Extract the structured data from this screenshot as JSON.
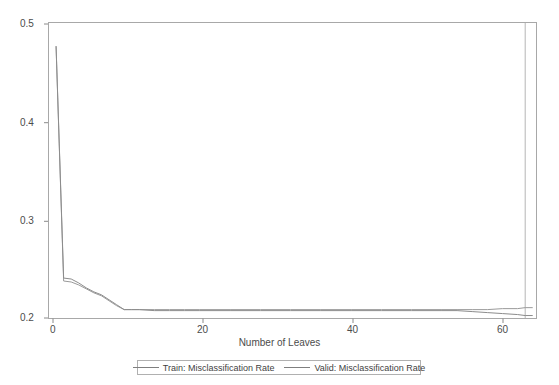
{
  "chart_data": {
    "type": "line",
    "title": "",
    "xlabel": "Number of Leaves",
    "ylabel": "",
    "xlim": [
      0,
      64.5
    ],
    "ylim": [
      0.2,
      0.5
    ],
    "xticks": [
      0,
      20,
      40,
      60
    ],
    "xtick_labels": [
      "0",
      "20",
      "40",
      "60"
    ],
    "yticks": [
      0.2,
      0.3,
      0.4,
      0.5
    ],
    "ytick_labels": [
      "0.2",
      "0.3",
      "0.4",
      "0.5"
    ],
    "grid": false,
    "legend_position": "bottom-center",
    "reference_line_x": 63,
    "x": [
      1,
      2,
      3,
      4,
      5,
      6,
      7,
      8,
      9,
      10,
      11,
      12,
      14,
      16,
      18,
      20,
      24,
      28,
      32,
      36,
      40,
      44,
      48,
      52,
      54,
      56,
      58,
      60,
      62,
      63,
      64
    ],
    "series": [
      {
        "name": "Train: Misclassification Rate",
        "color": "#8c8c8c",
        "values": [
          0.476,
          0.241,
          0.24,
          0.236,
          0.231,
          0.227,
          0.224,
          0.219,
          0.214,
          0.209,
          0.209,
          0.209,
          0.208,
          0.208,
          0.208,
          0.208,
          0.208,
          0.208,
          0.208,
          0.208,
          0.208,
          0.208,
          0.208,
          0.208,
          0.208,
          0.207,
          0.206,
          0.205,
          0.204,
          0.203,
          0.203
        ]
      },
      {
        "name": "Valid: Misclassification Rate",
        "color": "#9a9a9a",
        "values": [
          0.476,
          0.238,
          0.237,
          0.234,
          0.23,
          0.226,
          0.223,
          0.218,
          0.213,
          0.209,
          0.209,
          0.209,
          0.209,
          0.209,
          0.209,
          0.209,
          0.209,
          0.209,
          0.209,
          0.209,
          0.209,
          0.209,
          0.209,
          0.209,
          0.209,
          0.209,
          0.209,
          0.21,
          0.21,
          0.211,
          0.211
        ]
      }
    ]
  },
  "legend": {
    "entries": [
      {
        "label": "Train: Misclassification Rate"
      },
      {
        "label": "Valid: Misclassification Rate"
      }
    ]
  },
  "axes": {
    "x_title": "Number of Leaves"
  },
  "colors": {
    "frame": "#a8a8a8",
    "train_line": "#8c8c8c",
    "valid_line": "#9a9a9a",
    "tick_text": "#4c4c4c",
    "background": "#ffffff"
  }
}
